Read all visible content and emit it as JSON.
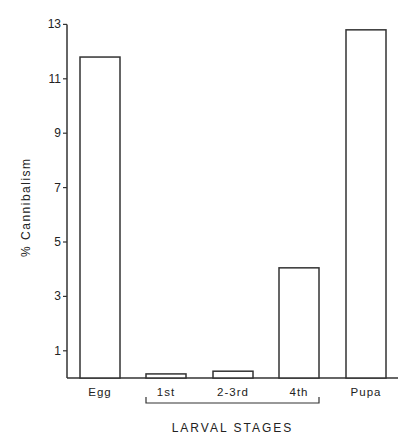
{
  "chart_data": {
    "type": "bar",
    "title": "",
    "xlabel": "",
    "ylabel": "% Cannibalism",
    "categories": [
      "Egg",
      "1st",
      "2-3rd",
      "4th",
      "Pupa"
    ],
    "values": [
      11.8,
      0.15,
      0.25,
      4.05,
      12.8
    ],
    "ylim": [
      0,
      13
    ],
    "yticks": [
      1,
      3,
      5,
      7,
      9,
      11,
      13
    ],
    "grid": false,
    "legend": null,
    "annotations": [
      {
        "text": "LARVAL STAGES",
        "spans": [
          "1st",
          "2-3rd",
          "4th"
        ],
        "style": "bracket below x-axis"
      }
    ],
    "bar_fill": "#ffffff",
    "bar_stroke": "#333333"
  }
}
